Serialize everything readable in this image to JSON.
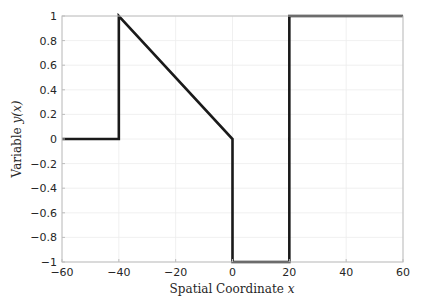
{
  "chart_data": {
    "type": "line",
    "title": "",
    "xlabel": "Spatial Coordinate x",
    "ylabel": "Variable y(x)",
    "xlim": [
      -60,
      60
    ],
    "ylim": [
      -1,
      1
    ],
    "xticks": [
      -60,
      -40,
      -20,
      0,
      20,
      40,
      60
    ],
    "yticks": [
      -1,
      -0.8,
      -0.6,
      -0.4,
      -0.2,
      0,
      0.2,
      0.4,
      0.6,
      0.8,
      1
    ],
    "xtick_labels": [
      "−60",
      "−40",
      "−20",
      "0",
      "20",
      "40",
      "60"
    ],
    "ytick_labels": [
      "−1",
      "−0.8",
      "−0.6",
      "−0.4",
      "−0.2",
      "0",
      "0.2",
      "0.4",
      "0.6",
      "0.8",
      "1"
    ],
    "grid": true,
    "legend": null,
    "series": [
      {
        "name": "y(x)",
        "color": "#1a1a1a",
        "x": [
          -60,
          -40,
          -40,
          0,
          0,
          20,
          20,
          60
        ],
        "y": [
          0,
          0,
          1,
          0,
          -1,
          -1,
          1,
          1
        ]
      }
    ]
  },
  "labels": {
    "xlabel_text": "Spatial Coordinate ",
    "xlabel_var": "x",
    "ylabel_text": "Variable ",
    "ylabel_var": "y(x)"
  }
}
